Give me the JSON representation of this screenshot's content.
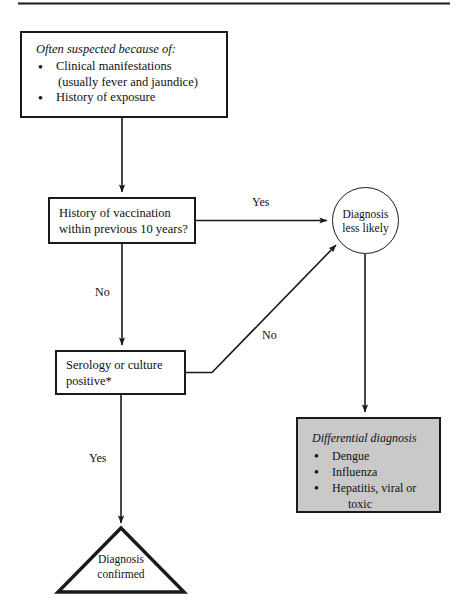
{
  "figure": {
    "type": "clinical-diagnostic-flowchart",
    "top_rule": true,
    "background_color": "#ffffff",
    "line_color": "#1a1a1a",
    "shaded_fill_color": "#c9c9c9"
  },
  "nodes": {
    "suspicion": {
      "shape": "rectangle",
      "heading": "Often suspected because of:",
      "bullets": [
        {
          "text": "Clinical manifestations",
          "continuation": "(usually fever and jaundice)"
        },
        {
          "text": "History of exposure",
          "continuation": ""
        }
      ]
    },
    "vaccination": {
      "shape": "rectangle",
      "line1": "History of vaccination",
      "line2": "within previous 10 years?"
    },
    "serology": {
      "shape": "rectangle",
      "line1": "Serology or culture",
      "line2": "positive*"
    },
    "less_likely": {
      "shape": "circle",
      "line1": "Diagnosis",
      "line2": "less likely"
    },
    "differential": {
      "shape": "rectangle-shaded",
      "heading": "Differential diagnosis",
      "bullets": [
        {
          "text": "Dengue",
          "continuation": ""
        },
        {
          "text": "Influenza",
          "continuation": ""
        },
        {
          "text": "Hepatitis, viral or",
          "continuation": "toxic"
        }
      ]
    },
    "confirmed": {
      "shape": "triangle",
      "line1": "Diagnosis",
      "line2": "confirmed"
    }
  },
  "edges": {
    "suspicion_to_vaccination": {
      "label": ""
    },
    "vaccination_yes": {
      "label": "Yes"
    },
    "vaccination_no": {
      "label": "No"
    },
    "serology_no": {
      "label": "No"
    },
    "serology_yes": {
      "label": "Yes"
    },
    "less_likely_to_differential": {
      "label": ""
    }
  }
}
